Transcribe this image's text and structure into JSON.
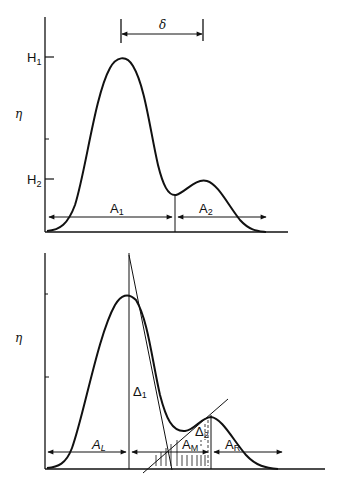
{
  "figure": {
    "top_panel": {
      "y_axis_label": "η",
      "tick_labels": {
        "h1_main": "H",
        "h1_sub": "1",
        "h2_main": "H",
        "h2_sub": "2"
      },
      "separation_label": "δ",
      "area_labels": {
        "a1_main": "A",
        "a1_sub": "1",
        "a2_main": "A",
        "a2_sub": "2"
      }
    },
    "bottom_panel": {
      "y_axis_label": "η",
      "delta1_main": "Δ",
      "delta1_sub": "1",
      "delta2_main": "Δ",
      "delta2_sub": "2",
      "area_labels": {
        "al_main": "A",
        "al_sub": "L",
        "am_main": "A",
        "am_sub": "M",
        "ar_main": "A",
        "ar_sub": "R"
      }
    },
    "colors": {
      "ink": "#111111",
      "background": "#ffffff"
    }
  }
}
